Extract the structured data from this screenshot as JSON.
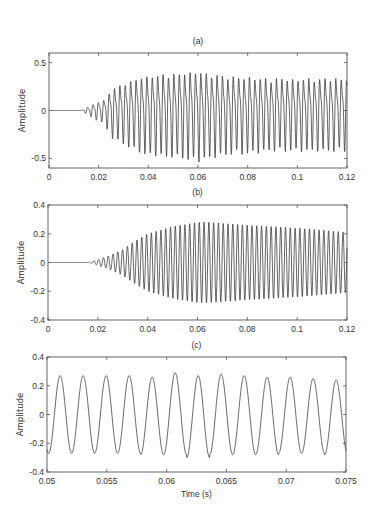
{
  "chart_data": [
    {
      "type": "line",
      "panel": "a",
      "title": "(a)",
      "xlabel": "",
      "ylabel": "Amplitude",
      "xlim": [
        0,
        0.12
      ],
      "ylim": [
        -0.6,
        0.6
      ],
      "xticks": [
        0,
        0.02,
        0.04,
        0.06,
        0.08,
        0.1,
        0.12
      ],
      "xtick_labels": [
        "0",
        "0.02",
        "0.04",
        "0.06",
        "0.08",
        "0.1",
        "0.12"
      ],
      "yticks": [
        -0.5,
        0,
        0.5
      ],
      "ytick_labels": [
        "-0.5",
        "0",
        "0.5"
      ],
      "grid": false,
      "legend": null,
      "description": "Noisy multi-component oscillation; silent until ~0.013 s, onset ~0.017 s, envelope grows to ~0.45 near 0.06 s then stays ~0.35-0.4 until 0.12 s",
      "signal": {
        "onset": 0.013,
        "frequency_hz": 460,
        "harmonic_ratio": 2.0,
        "harmonic_amp": 0.35,
        "envelope_t": [
          0,
          0.013,
          0.018,
          0.022,
          0.025,
          0.03,
          0.035,
          0.04,
          0.05,
          0.06,
          0.07,
          0.08,
          0.09,
          0.1,
          0.11,
          0.12
        ],
        "envelope_a": [
          0,
          0,
          0.08,
          0.12,
          0.25,
          0.32,
          0.38,
          0.42,
          0.44,
          0.47,
          0.42,
          0.4,
          0.38,
          0.38,
          0.38,
          0.38
        ],
        "jitter": 0.12
      }
    },
    {
      "type": "line",
      "panel": "b",
      "title": "(b)",
      "xlabel": "",
      "ylabel": "Amplitude",
      "xlim": [
        0,
        0.12
      ],
      "ylim": [
        -0.4,
        0.4
      ],
      "xticks": [
        0,
        0.02,
        0.04,
        0.06,
        0.08,
        0.1,
        0.12
      ],
      "xtick_labels": [
        "0",
        "0.02",
        "0.04",
        "0.06",
        "0.08",
        "0.1",
        "0.12"
      ],
      "yticks": [
        -0.4,
        -0.2,
        0,
        0.2,
        0.4
      ],
      "ytick_labels": [
        "-0.4",
        "-0.2",
        "0",
        "0.2",
        "0.4"
      ],
      "grid": false,
      "legend": null,
      "description": "Clean sinusoid (~520 Hz) with envelope rising from ~0.017 s, peaking ~0.28 near 0.062 s, decaying to ~0.21 at 0.12 s",
      "signal": {
        "onset": 0.016,
        "frequency_hz": 520,
        "harmonic_ratio": 0,
        "harmonic_amp": 0,
        "envelope_t": [
          0,
          0.016,
          0.02,
          0.025,
          0.03,
          0.035,
          0.04,
          0.05,
          0.06,
          0.065,
          0.08,
          0.1,
          0.12
        ],
        "envelope_a": [
          0,
          0,
          0.02,
          0.05,
          0.09,
          0.15,
          0.2,
          0.25,
          0.28,
          0.28,
          0.26,
          0.24,
          0.21
        ],
        "jitter": 0
      }
    },
    {
      "type": "line",
      "panel": "c",
      "title": "(c)",
      "xlabel": "Time (s)",
      "ylabel": "Amplitude",
      "xlim": [
        0.05,
        0.075
      ],
      "ylim": [
        -0.4,
        0.4
      ],
      "xticks": [
        0.05,
        0.055,
        0.06,
        0.065,
        0.07,
        0.075
      ],
      "xtick_labels": [
        "0.05",
        "0.055",
        "0.06",
        "0.065",
        "0.07",
        "0.075"
      ],
      "yticks": [
        -0.4,
        -0.2,
        0,
        0.2,
        0.4
      ],
      "ytick_labels": [
        "-0.4",
        "-0.2",
        "0",
        "0.2",
        "0.4"
      ],
      "grid": false,
      "legend": null,
      "description": "Zoomed view of (b) from 0.05 to 0.075 s: ~13 cycles of a ~520 Hz sinusoid, amplitude ~0.27",
      "peaks_t": [
        0.0511,
        0.053,
        0.0549,
        0.0568,
        0.0587,
        0.0606,
        0.0626,
        0.0645,
        0.0664,
        0.0683,
        0.0702,
        0.0722,
        0.0741
      ],
      "peaks_y": [
        0.27,
        0.27,
        0.27,
        0.27,
        0.26,
        0.29,
        0.27,
        0.28,
        0.27,
        0.26,
        0.26,
        0.25,
        0.24
      ],
      "troughs_y": [
        -0.27,
        -0.27,
        -0.27,
        -0.27,
        -0.28,
        -0.28,
        -0.3,
        -0.28,
        -0.28,
        -0.28,
        -0.27,
        -0.27,
        -0.28
      ],
      "signal": {
        "onset": 0,
        "frequency_hz": 520,
        "phase_peak_t": 0.0511,
        "amplitude": 0.27
      }
    }
  ],
  "layout": {
    "panels": [
      {
        "id": "a",
        "box": [
          49,
          53,
          347,
          168
        ],
        "title_y": 41
      },
      {
        "id": "b",
        "box": [
          48,
          205,
          347,
          320
        ],
        "title_y": 192
      },
      {
        "id": "c",
        "box": [
          47,
          357,
          346,
          472
        ],
        "title_y": 345
      }
    ],
    "xlabel_y": 497
  }
}
